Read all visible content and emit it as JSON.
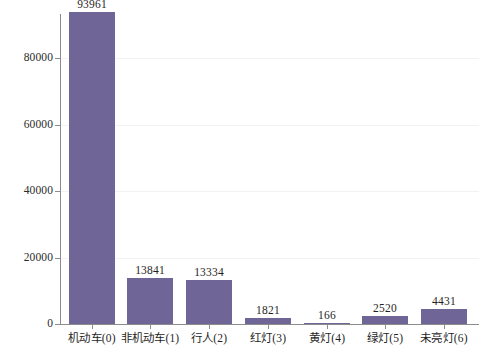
{
  "chart_data": {
    "type": "bar",
    "title": "",
    "subtitle": "",
    "xlabel": "",
    "ylabel": "",
    "categories": [
      "机动车(0)",
      "非机动车(1)",
      "行人(2)",
      "红灯(3)",
      "黄灯(4)",
      "绿灯(5)",
      "未亮灯(6)"
    ],
    "values": [
      93961,
      13841,
      13334,
      1821,
      166,
      2520,
      4431
    ],
    "value_labels": [
      "93961",
      "13841",
      "13334",
      "1821",
      "166",
      "2520",
      "4431"
    ],
    "ylim": [
      0,
      100000
    ],
    "yticks": [
      0,
      20000,
      40000,
      60000,
      80000
    ],
    "ytick_labels": [
      "0",
      "20000",
      "40000",
      "60000",
      "80000"
    ],
    "grid": true,
    "legend": null,
    "legend_position": "none",
    "bar_color": "#6f6596",
    "axis_color": "#8c8c8c",
    "grid_color": "#f2f2f4",
    "background_color": "#ffffff"
  }
}
